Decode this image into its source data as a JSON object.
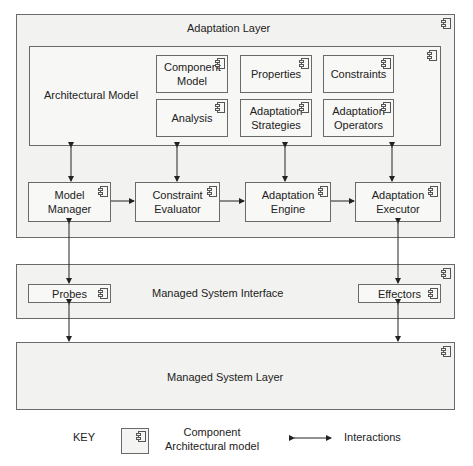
{
  "adaptation_layer": {
    "title": "Adaptation Layer",
    "architectural_model": {
      "title": "Architectural Model",
      "components": [
        {
          "label": "Component Model"
        },
        {
          "label": "Properties"
        },
        {
          "label": "Constraints"
        },
        {
          "label": "Analysis"
        },
        {
          "label": "Adaptation Strategies"
        },
        {
          "label": "Adaptation Operators"
        }
      ]
    },
    "pipeline": [
      {
        "label": "Model Manager"
      },
      {
        "label": "Constraint Evaluator"
      },
      {
        "label": "Adaptation Engine"
      },
      {
        "label": "Adaptation Executor"
      }
    ]
  },
  "managed_system_interface": {
    "title": "Managed System Interface",
    "probes": "Probes",
    "effectors": "Effectors"
  },
  "managed_system_layer": {
    "title": "Managed System Layer"
  },
  "key": {
    "title": "KEY",
    "component_label_line1": "Component",
    "component_label_line2": "Architectural model",
    "interactions_label": "Interactions"
  },
  "icons": {
    "component": "uml-component-icon",
    "interaction": "double-headed-arrow-icon"
  },
  "colors": {
    "stroke": "#6a6a6a",
    "fill": "#f4f4f2",
    "arrow": "#222222"
  }
}
